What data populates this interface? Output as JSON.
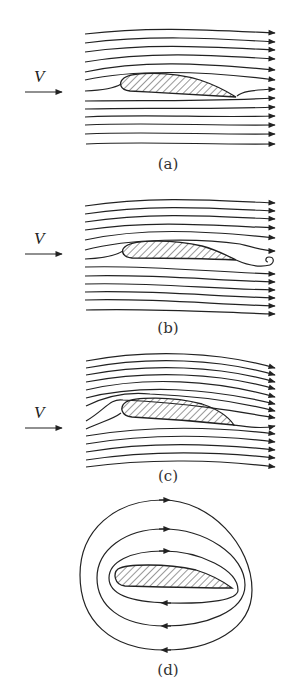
{
  "figure": {
    "freestream_symbol": "V",
    "colors": {
      "stroke": "#222222",
      "background": "#ffffff",
      "hatch": "#333333"
    },
    "panels": [
      {
        "id": "a",
        "label": "(a)",
        "desc": "Potential flow with zero circulation; rear stagnation point on the upper surface, flow wraps around trailing edge",
        "has_freestream": true
      },
      {
        "id": "b",
        "label": "(b)",
        "desc": "Starting vortex shed from trailing edge",
        "has_freestream": true,
        "annotation": "starting-vortex"
      },
      {
        "id": "c",
        "label": "(c)",
        "desc": "Steady flow satisfying Kutta condition; smooth flow-off at trailing edge",
        "has_freestream": true
      },
      {
        "id": "d",
        "label": "(d)",
        "desc": "Pure circulation around airfoil (clockwise closed streamlines)",
        "has_freestream": false
      }
    ]
  }
}
